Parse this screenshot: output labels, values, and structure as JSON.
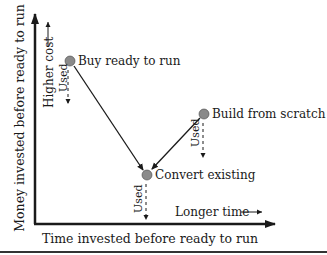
{
  "diagram": {
    "y_axis_label": "Money invested before ready to run",
    "x_axis_label": "Time invested before ready to run",
    "higher_cost_label": "Higher cost",
    "longer_time_label": "Longer time",
    "nodes": [
      {
        "id": "buy",
        "label": "Buy ready to run",
        "used_label": "Used"
      },
      {
        "id": "build",
        "label": "Build from scratch",
        "used_label": "Used"
      },
      {
        "id": "convert",
        "label": "Convert existing",
        "used_label": "Used"
      }
    ],
    "edges": [
      {
        "from": "buy",
        "to": "convert"
      },
      {
        "from": "build",
        "to": "convert"
      }
    ],
    "colors": {
      "node_fill": "#8a8a8a",
      "line": "#1a1a1a"
    }
  }
}
